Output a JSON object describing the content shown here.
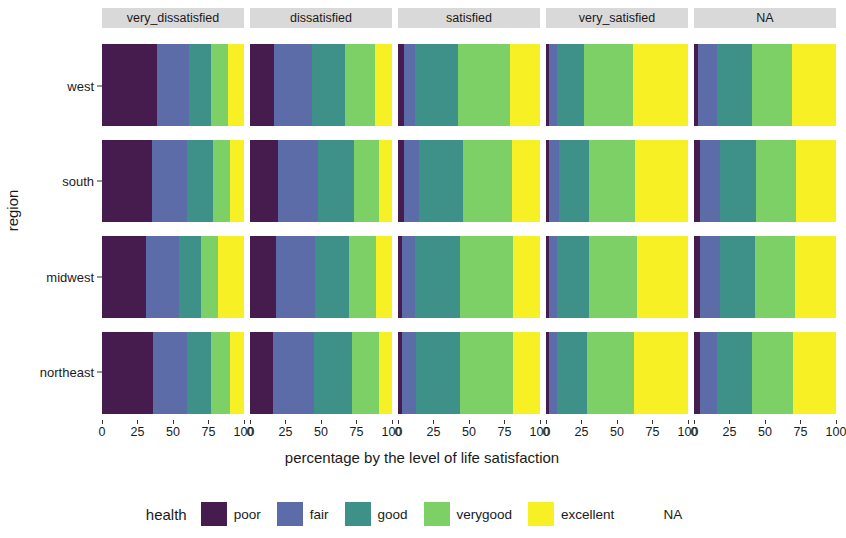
{
  "chart_data": {
    "type": "bar",
    "subtype": "stacked-horizontal-faceted-100pct",
    "title": "",
    "xlabel": "percentage by the level of life satisfaction",
    "ylabel": "region",
    "xlim": [
      0,
      100
    ],
    "xticks": [
      0,
      25,
      50,
      75,
      100
    ],
    "xtick_labels": [
      "0",
      "25",
      "50",
      "75",
      "100"
    ],
    "grid": false,
    "legend_title": "health",
    "legend_position": "bottom",
    "facet_variable": "life_satisfaction",
    "facets": [
      "very_dissatisfied",
      "dissatisfied",
      "satisfied",
      "very_satisfied",
      "NA"
    ],
    "categories": [
      "west",
      "south",
      "midwest",
      "northeast"
    ],
    "series": [
      {
        "name": "poor",
        "color": "#461C4E"
      },
      {
        "name": "fair",
        "color": "#5C6CA8"
      },
      {
        "name": "good",
        "color": "#3E9189"
      },
      {
        "name": "verygood",
        "color": "#7DD066"
      },
      {
        "name": "excellent",
        "color": "#F7F024"
      },
      {
        "name": "NA",
        "color": "#FFFFFF"
      }
    ],
    "panels": [
      {
        "facet": "very_dissatisfied",
        "rows": [
          {
            "category": "west",
            "values": [
              39,
              22,
              16,
              12,
              11,
              0
            ]
          },
          {
            "category": "south",
            "values": [
              35,
              25,
              18,
              12,
              10,
              0
            ]
          },
          {
            "category": "midwest",
            "values": [
              31,
              23,
              16,
              12,
              18,
              0
            ]
          },
          {
            "category": "northeast",
            "values": [
              36,
              24,
              17,
              13,
              10,
              0
            ]
          }
        ]
      },
      {
        "facet": "dissatisfied",
        "rows": [
          {
            "category": "west",
            "values": [
              17,
              27,
              23,
              21,
              12,
              0
            ]
          },
          {
            "category": "south",
            "values": [
              20,
              28,
              25,
              18,
              9,
              0
            ]
          },
          {
            "category": "midwest",
            "values": [
              18,
              28,
              24,
              19,
              11,
              0
            ]
          },
          {
            "category": "northeast",
            "values": [
              16,
              29,
              27,
              19,
              9,
              0
            ]
          }
        ]
      },
      {
        "facet": "satisfied",
        "rows": [
          {
            "category": "west",
            "values": [
              4,
              8,
              30,
              37,
              21,
              0
            ]
          },
          {
            "category": "south",
            "values": [
              4,
              11,
              31,
              34,
              20,
              0
            ]
          },
          {
            "category": "midwest",
            "values": [
              3,
              9,
              32,
              37,
              19,
              0
            ]
          },
          {
            "category": "northeast",
            "values": [
              3,
              10,
              31,
              37,
              19,
              0
            ]
          }
        ]
      },
      {
        "facet": "very_satisfied",
        "rows": [
          {
            "category": "west",
            "values": [
              2,
              6,
              19,
              34,
              39,
              0
            ]
          },
          {
            "category": "south",
            "values": [
              2,
              7,
              21,
              33,
              37,
              0
            ]
          },
          {
            "category": "midwest",
            "values": [
              2,
              6,
              22,
              34,
              36,
              0
            ]
          },
          {
            "category": "northeast",
            "values": [
              2,
              6,
              21,
              33,
              38,
              0
            ]
          }
        ]
      },
      {
        "facet": "NA",
        "rows": [
          {
            "category": "west",
            "values": [
              3,
              13,
              25,
              28,
              31,
              0
            ]
          },
          {
            "category": "south",
            "values": [
              4,
              14,
              26,
              28,
              28,
              0
            ]
          },
          {
            "category": "midwest",
            "values": [
              4,
              14,
              25,
              28,
              29,
              0
            ]
          },
          {
            "category": "northeast",
            "values": [
              4,
              12,
              25,
              29,
              30,
              0
            ]
          }
        ]
      }
    ]
  },
  "axes": {
    "y_title": "region",
    "x_title": "percentage by the level of life satisfaction",
    "y_labels": [
      "west",
      "south",
      "midwest",
      "northeast"
    ],
    "x_tick_labels": [
      "0",
      "25",
      "50",
      "75",
      "100"
    ]
  },
  "strips": [
    {
      "label": "very_dissatisfied"
    },
    {
      "label": "dissatisfied"
    },
    {
      "label": "satisfied"
    },
    {
      "label": "very_satisfied"
    },
    {
      "label": "NA"
    }
  ],
  "legend": {
    "title": "health",
    "items": [
      {
        "label": "poor",
        "color": "#461C4E"
      },
      {
        "label": "fair",
        "color": "#5C6CA8"
      },
      {
        "label": "good",
        "color": "#3E9189"
      },
      {
        "label": "verygood",
        "color": "#7DD066"
      },
      {
        "label": "excellent",
        "color": "#F7F024"
      },
      {
        "label": "NA",
        "color": "#FFFFFF"
      }
    ]
  },
  "colors": {
    "strip_background": "#d9d9d9",
    "panel_background": "#ffffff",
    "text": "#1a1a1a",
    "tick": "#333333"
  }
}
